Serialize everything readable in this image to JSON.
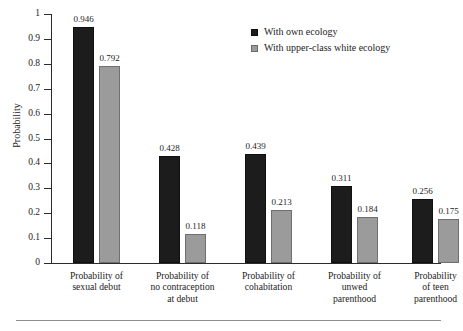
{
  "chart_data": {
    "type": "bar",
    "title": "",
    "xlabel": "",
    "ylabel": "Probability",
    "ylim": [
      0,
      1
    ],
    "yticks": [
      "0",
      "0.1",
      "0.2",
      "0.3",
      "0.4",
      "0.5",
      "0.6",
      "0.7",
      "0.8",
      "0.9",
      "1"
    ],
    "ytick_values": [
      0,
      0.1,
      0.2,
      0.3,
      0.4,
      0.5,
      0.6,
      0.7,
      0.8,
      0.9,
      1
    ],
    "grid": false,
    "legend_position": "top-right",
    "categories": [
      "Probability of\nsexual debut",
      "Probability of\nno contraception\nat debut",
      "Probability of\ncohabitation",
      "Probability of\nunwed\nparenthood",
      "Probability\nof teen\nparenthood"
    ],
    "series": [
      {
        "name": "With own ecology",
        "color": "#1c1c1c",
        "values": [
          0.946,
          0.428,
          0.439,
          0.311,
          0.256
        ],
        "labels": [
          "0.946",
          "0.428",
          "0.439",
          "0.311",
          "0.256"
        ]
      },
      {
        "name": "With upper-class white ecology",
        "color": "#9b9b9b",
        "values": [
          0.792,
          0.118,
          0.213,
          0.184,
          0.175
        ],
        "labels": [
          "0.792",
          "0.118",
          "0.213",
          "0.184",
          "0.175"
        ]
      }
    ]
  },
  "legend": {
    "items": [
      {
        "label": "With own ecology",
        "swatch": "own"
      },
      {
        "label": "With upper-class white ecology",
        "swatch": "upper"
      }
    ]
  }
}
